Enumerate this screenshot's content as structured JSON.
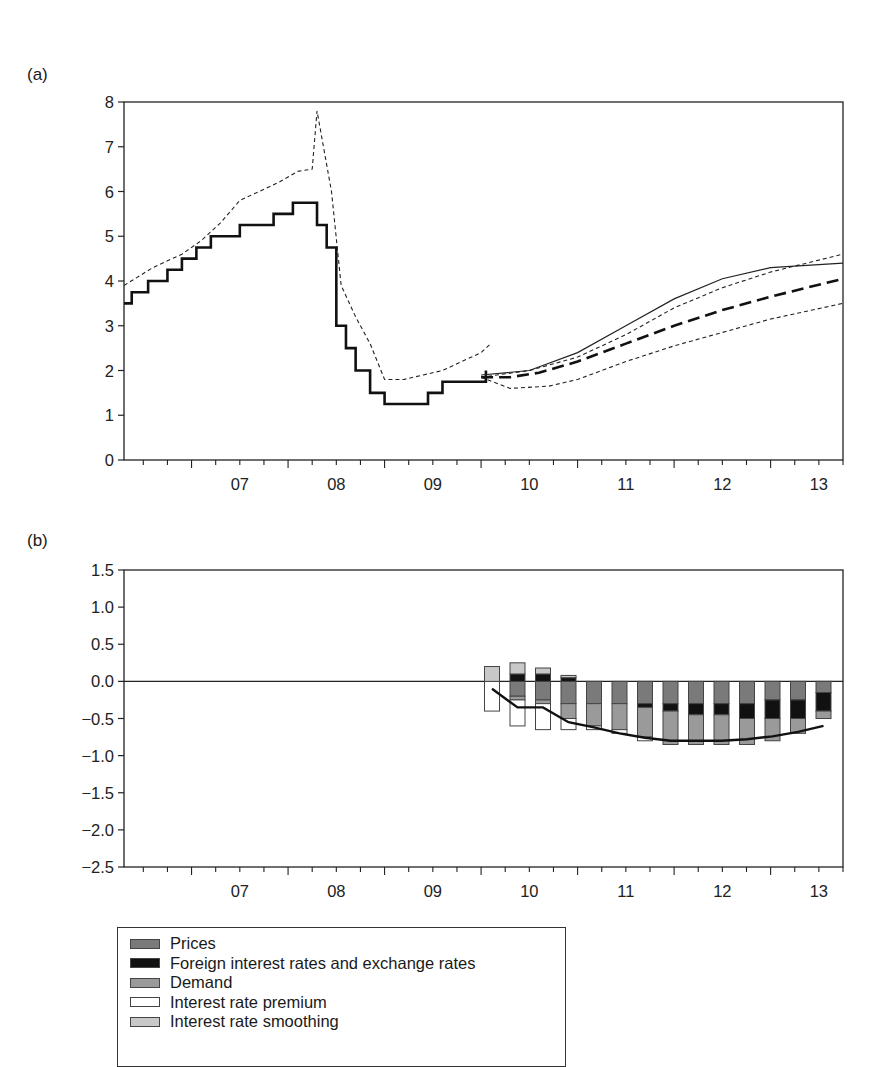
{
  "panels": {
    "a": {
      "label": "(a)"
    },
    "b": {
      "label": "(b)"
    }
  },
  "chart_data": [
    {
      "id": "a",
      "type": "line",
      "title": "(a)",
      "xlabel": "",
      "ylabel": "",
      "ylim": [
        0,
        8
      ],
      "xlim": [
        2006.3,
        2013.75
      ],
      "yticks": [
        0,
        1,
        2,
        3,
        4,
        5,
        6,
        7,
        8
      ],
      "xtick_labels": [
        "07",
        "08",
        "09",
        "10",
        "11",
        "12",
        "13"
      ],
      "grid": false,
      "legend": null,
      "series": [
        {
          "name": "Policy rate (step, solid thick)",
          "style": "step-solid-thick",
          "x": [
            2006.3,
            2006.38,
            2006.55,
            2006.75,
            2006.9,
            2007.05,
            2007.2,
            2007.5,
            2007.85,
            2008.05,
            2008.3,
            2008.4,
            2008.5,
            2008.6,
            2008.7,
            2008.85,
            2009.0,
            2009.2,
            2009.45,
            2009.6,
            2010.05
          ],
          "values": [
            3.5,
            3.75,
            4.0,
            4.25,
            4.5,
            4.75,
            5.0,
            5.25,
            5.5,
            5.75,
            5.25,
            4.75,
            3.0,
            2.5,
            2.0,
            1.5,
            1.25,
            1.25,
            1.5,
            1.75,
            2.0
          ]
        },
        {
          "name": "Market rate (dashed, daily)",
          "style": "dashed-thin",
          "x": [
            2006.3,
            2006.6,
            2006.9,
            2007.1,
            2007.3,
            2007.5,
            2007.7,
            2007.9,
            2008.1,
            2008.25,
            2008.3,
            2008.35,
            2008.45,
            2008.55,
            2008.7,
            2008.85,
            2009.0,
            2009.2,
            2009.4,
            2009.6,
            2009.8,
            2010.0,
            2010.1
          ],
          "values": [
            3.9,
            4.3,
            4.6,
            4.9,
            5.3,
            5.8,
            6.0,
            6.2,
            6.45,
            6.5,
            7.8,
            7.2,
            6.0,
            3.9,
            3.2,
            2.6,
            1.8,
            1.8,
            1.9,
            2.0,
            2.2,
            2.4,
            2.6
          ]
        },
        {
          "name": "Forecast (thin solid)",
          "style": "solid-thin",
          "x": [
            2010.0,
            2010.5,
            2011.0,
            2011.5,
            2012.0,
            2012.5,
            2013.0,
            2013.75
          ],
          "values": [
            1.9,
            2.0,
            2.4,
            3.0,
            3.6,
            4.05,
            4.3,
            4.4
          ]
        },
        {
          "name": "Forecast upper band (dashed thin)",
          "style": "dashed-thin",
          "x": [
            2010.0,
            2010.5,
            2011.0,
            2011.5,
            2012.0,
            2012.5,
            2013.0,
            2013.75
          ],
          "values": [
            1.85,
            2.0,
            2.3,
            2.8,
            3.4,
            3.85,
            4.2,
            4.6
          ]
        },
        {
          "name": "Forecast central (dashed thick)",
          "style": "dashed-thick",
          "x": [
            2010.0,
            2010.3,
            2010.6,
            2011.0,
            2011.5,
            2012.0,
            2012.5,
            2013.0,
            2013.75
          ],
          "values": [
            1.85,
            1.85,
            1.95,
            2.2,
            2.6,
            3.0,
            3.35,
            3.65,
            4.05
          ]
        },
        {
          "name": "Forecast lower band (dashed thin)",
          "style": "dashed-thin",
          "x": [
            2010.0,
            2010.3,
            2010.7,
            2011.0,
            2011.5,
            2012.0,
            2012.5,
            2013.0,
            2013.75
          ],
          "values": [
            1.85,
            1.6,
            1.65,
            1.8,
            2.2,
            2.55,
            2.85,
            3.15,
            3.5
          ]
        }
      ]
    },
    {
      "id": "b",
      "type": "bar",
      "stacked": true,
      "title": "(b)",
      "xlabel": "",
      "ylabel": "",
      "ylim": [
        -2.5,
        1.5
      ],
      "yticks": [
        -2.5,
        -2.0,
        -1.5,
        -1.0,
        -0.5,
        0.0,
        0.5,
        1.0,
        1.5
      ],
      "ytick_labels": [
        "−2.5",
        "−2.0",
        "−1.5",
        "−1.0",
        "−0.5",
        "0.0",
        "0.5",
        "1.0",
        "1.5"
      ],
      "xtick_labels": [
        "07",
        "08",
        "09",
        "10",
        "11",
        "12",
        "13"
      ],
      "grid": false,
      "legend_position": "below",
      "categories": [
        "Q1-10",
        "Q2-10",
        "Q3-10",
        "Q4-10",
        "Q1-11",
        "Q2-11",
        "Q3-11",
        "Q4-11",
        "Q1-12",
        "Q2-12",
        "Q3-12",
        "Q4-12",
        "Q1-13",
        "Q2-13"
      ],
      "series": [
        {
          "name": "Prices",
          "color": "#7a7a7a",
          "values": [
            0.0,
            -0.2,
            -0.25,
            -0.3,
            -0.3,
            -0.3,
            -0.3,
            -0.3,
            -0.3,
            -0.3,
            -0.3,
            -0.25,
            -0.25,
            -0.15
          ]
        },
        {
          "name": "Foreign interest rates and exchange rates",
          "color": "#111111",
          "values": [
            0.0,
            0.1,
            0.1,
            0.05,
            0.0,
            0.0,
            -0.05,
            -0.1,
            -0.15,
            -0.15,
            -0.2,
            -0.25,
            -0.25,
            -0.25
          ]
        },
        {
          "name": "Demand",
          "color": "#9a9a9a",
          "values": [
            0.0,
            -0.05,
            -0.05,
            -0.2,
            -0.3,
            -0.35,
            -0.4,
            -0.45,
            -0.4,
            -0.4,
            -0.35,
            -0.3,
            -0.2,
            -0.1
          ]
        },
        {
          "name": "Interest rate premium",
          "color": "#ffffff",
          "values": [
            -0.4,
            -0.35,
            -0.35,
            -0.15,
            -0.05,
            -0.05,
            -0.05,
            0.0,
            0.0,
            0.0,
            0.0,
            0.0,
            0.0,
            0.0
          ]
        },
        {
          "name": "Interest rate smoothing",
          "color": "#c8c8c8",
          "values": [
            0.2,
            0.15,
            0.08,
            0.03,
            0.0,
            0.0,
            0.0,
            0.0,
            0.0,
            0.0,
            0.0,
            0.0,
            0.0,
            0.0
          ]
        }
      ],
      "line": {
        "name": "Total deviation",
        "values": [
          -0.1,
          -0.35,
          -0.35,
          -0.55,
          -0.62,
          -0.7,
          -0.76,
          -0.8,
          -0.8,
          -0.8,
          -0.78,
          -0.74,
          -0.68,
          -0.6
        ]
      }
    }
  ],
  "legend": {
    "items": [
      {
        "label": "Prices",
        "color": "#7a7a7a"
      },
      {
        "label": "Foreign interest rates and exchange rates",
        "color": "#111111"
      },
      {
        "label": "Demand",
        "color": "#9a9a9a"
      },
      {
        "label": "Interest rate premium",
        "color": "#ffffff"
      },
      {
        "label": "Interest rate smoothing",
        "color": "#c8c8c8"
      }
    ]
  }
}
